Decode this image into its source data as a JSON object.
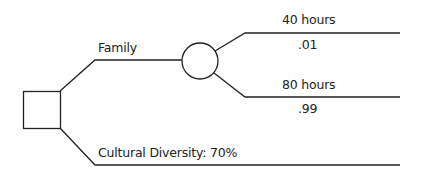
{
  "diagram": {
    "type": "decision-tree",
    "decision_node": {
      "shape": "square"
    },
    "branches": [
      {
        "label": "Family",
        "chance_node": {
          "shape": "circle"
        },
        "outcomes": [
          {
            "label": "40 hours",
            "probability": ".01"
          },
          {
            "label": "80 hours",
            "probability": ".99"
          }
        ]
      },
      {
        "label": "Cultural Diversity: 70%"
      }
    ]
  }
}
